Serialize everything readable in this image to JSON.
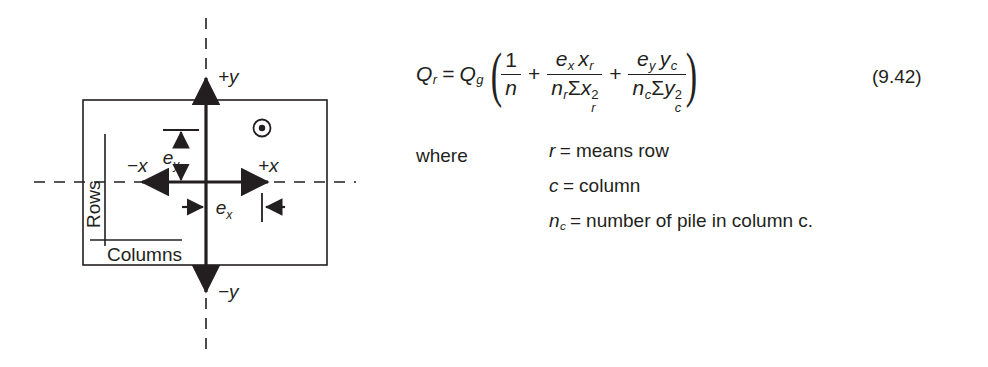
{
  "figure": {
    "name": "pile-group-eccentricity-diagram",
    "labels": {
      "plus_y": "+y",
      "minus_y": "−y",
      "plus_x": "+x",
      "minus_x": "−x",
      "e_x_base": "e",
      "e_x_sub": "x",
      "e_y_base": "e",
      "e_y_sub": "y",
      "rows": "Rows",
      "columns": "Columns"
    },
    "icons": {
      "pile_marker": "circled-dot-icon"
    },
    "colors": {
      "ink": "#231f20",
      "background": "#ffffff"
    }
  },
  "equation": {
    "number": "(9.42)",
    "lhs": {
      "base": "Q",
      "sub": "r"
    },
    "rhs_factor": {
      "base": "Q",
      "sub": "g"
    },
    "equals": "=",
    "plus": "+",
    "term1": {
      "numerator": "1",
      "denominator": "n"
    },
    "term2": {
      "num_e": "e",
      "num_e_sub": "x",
      "num_x": "x",
      "num_x_sub": "r",
      "den_n": "n",
      "den_n_sub": "r",
      "den_sigma": "Σ",
      "den_var": "x",
      "den_var_sub": "r",
      "den_var_sup": "2"
    },
    "term3": {
      "num_e": "e",
      "num_e_sub": "y",
      "num_x": "y",
      "num_x_sub": "c",
      "den_n": "n",
      "den_n_sub": "c",
      "den_sigma": "Σ",
      "den_var": "y",
      "den_var_sub": "c",
      "den_var_sup": "2"
    }
  },
  "where": {
    "label": "where",
    "definitions": [
      {
        "symbol": "r",
        "symbol_sub": "",
        "equals": "=",
        "text": "means row"
      },
      {
        "symbol": "c",
        "symbol_sub": "",
        "equals": "=",
        "text": "column"
      },
      {
        "symbol": "n",
        "symbol_sub": "c",
        "equals": "=",
        "text": "number of pile in column c."
      }
    ]
  }
}
